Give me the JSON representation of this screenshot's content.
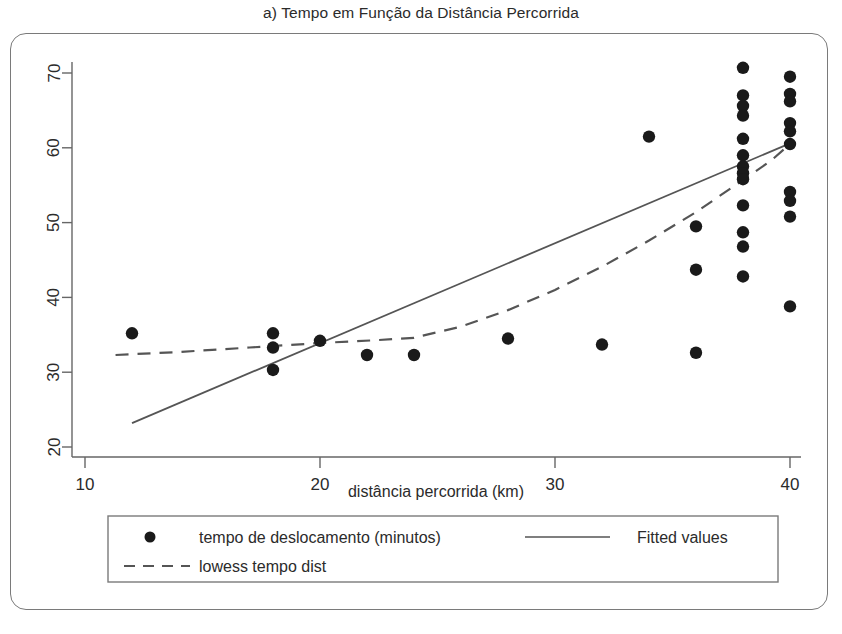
{
  "chart_data": {
    "type": "scatter",
    "title": "a) Tempo em Função da Distância Percorrida",
    "xlabel": "distância percorrida (km)",
    "ylabel": "",
    "xlim": [
      10,
      41
    ],
    "ylim": [
      18.5,
      72.5
    ],
    "xticks": [
      10,
      20,
      30,
      40
    ],
    "yticks": [
      20,
      30,
      40,
      50,
      60,
      70
    ],
    "grid": false,
    "legend_position": "below-axes",
    "series": [
      {
        "name": "tempo de deslocamento (minutos)",
        "type": "scatter",
        "marker": "circle",
        "color": "#1a1a1a",
        "points": [
          [
            12.0,
            35.2
          ],
          [
            18.0,
            35.2
          ],
          [
            18.0,
            33.3
          ],
          [
            18.0,
            30.3
          ],
          [
            20.0,
            34.2
          ],
          [
            22.0,
            32.3
          ],
          [
            24.0,
            32.3
          ],
          [
            28.0,
            34.5
          ],
          [
            32.0,
            33.7
          ],
          [
            34.0,
            61.5
          ],
          [
            36.0,
            49.5
          ],
          [
            36.0,
            43.7
          ],
          [
            36.0,
            32.6
          ],
          [
            38.0,
            70.7
          ],
          [
            38.0,
            67.0
          ],
          [
            38.0,
            65.6
          ],
          [
            38.0,
            64.3
          ],
          [
            38.0,
            61.2
          ],
          [
            38.0,
            59.0
          ],
          [
            38.0,
            57.5
          ],
          [
            38.0,
            56.6
          ],
          [
            38.0,
            55.8
          ],
          [
            38.0,
            52.3
          ],
          [
            38.0,
            48.7
          ],
          [
            38.0,
            46.8
          ],
          [
            38.0,
            42.8
          ],
          [
            40.0,
            69.5
          ],
          [
            40.0,
            67.2
          ],
          [
            40.0,
            66.2
          ],
          [
            40.0,
            63.3
          ],
          [
            40.0,
            62.2
          ],
          [
            40.0,
            60.5
          ],
          [
            40.0,
            54.1
          ],
          [
            40.0,
            52.9
          ],
          [
            40.0,
            50.8
          ],
          [
            40.0,
            38.8
          ]
        ]
      },
      {
        "name": "Fitted values",
        "type": "line",
        "style": "solid",
        "color": "#555555",
        "points": [
          [
            12.0,
            23.2
          ],
          [
            40.0,
            60.6
          ]
        ]
      },
      {
        "name": "lowess tempo dist",
        "type": "line",
        "style": "dashed",
        "color": "#555555",
        "points": [
          [
            11.3,
            32.3
          ],
          [
            14.0,
            32.7
          ],
          [
            17.0,
            33.3
          ],
          [
            20.0,
            33.9
          ],
          [
            22.5,
            34.3
          ],
          [
            24.0,
            34.6
          ],
          [
            26.0,
            36.1
          ],
          [
            28.0,
            38.3
          ],
          [
            30.0,
            41.0
          ],
          [
            32.0,
            44.1
          ],
          [
            34.0,
            47.6
          ],
          [
            36.0,
            51.4
          ],
          [
            38.0,
            55.7
          ],
          [
            39.2,
            58.3
          ],
          [
            40.0,
            60.5
          ]
        ]
      }
    ]
  },
  "legend": {
    "entries": [
      {
        "key": "marker",
        "label": "tempo de deslocamento (minutos)"
      },
      {
        "key": "solid-line",
        "label": "Fitted values"
      },
      {
        "key": "dashed-line",
        "label": "lowess tempo dist"
      }
    ]
  },
  "colors": {
    "marker": "#1a1a1a",
    "line": "#555555",
    "axis": "#666666",
    "frame": "#7a7a7a",
    "text": "#2b2b2b",
    "background": "#ffffff"
  }
}
